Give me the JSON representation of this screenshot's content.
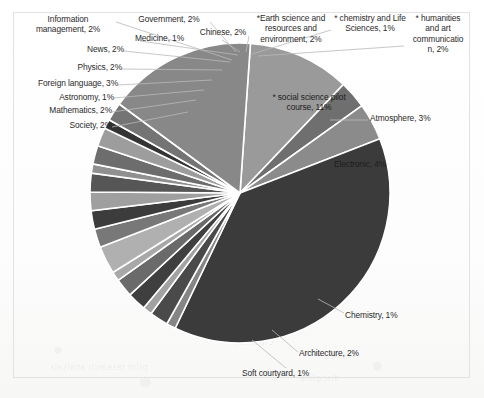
{
  "chart_data": {
    "type": "pie",
    "title": "",
    "legend_position": "none",
    "labels_outside": true,
    "units": "percent",
    "categories": [
      "* social science pilot course",
      "Atmosphere",
      "Electronic",
      "Computer",
      "Chemistry",
      "Architecture",
      "Soft courtyard",
      "Society",
      "Mathematics",
      "Astronomy",
      "Foreign language",
      "Physics",
      "News",
      "Information management",
      "Government",
      "Medicine",
      "Chinese",
      "* Earth science and resources and environment",
      "* chemistry and Life Sciences",
      "* humanities and art communication",
      "Other"
    ],
    "values": [
      11,
      3,
      4,
      38,
      1,
      2,
      1,
      2,
      2,
      1,
      3,
      2,
      2,
      2,
      2,
      1,
      2,
      2,
      1,
      2,
      16
    ],
    "value_labels": [
      "* social science pilot course, 11%",
      "Atmosphere, 3%",
      "Electronic, 4%",
      "",
      "Chemistry, 1%",
      "Architecture, 2%",
      "Soft courtyard, 1%",
      "Society, 2%",
      "Mathematics, 2%",
      "Astronomy, 1%",
      "Foreign language, 3%",
      "Physics, 2%",
      "News, 2%",
      "Information management, 2%",
      "Government, 2%",
      "Medicine, 1%",
      "Chinese, 2%",
      "*Earth science and resources and environment, 2%",
      "* chemistry and Life Sciences, 1%",
      "* humanities and art communication, 2%",
      ""
    ],
    "colors": [
      "#9a9a9a",
      "#6f6f6f",
      "#8b8b8b",
      "#3b3b3b",
      "#858585",
      "#4a4a4a",
      "#a2a2a2",
      "#3f3f3f",
      "#6a6a6a",
      "#a8a8a8",
      "#b0b0b0",
      "#787878",
      "#3c3c3c",
      "#9f9f9f",
      "#565656",
      "#909090",
      "#6d6d6d",
      "#9d9d9d",
      "#343434",
      "#747474",
      "#888888"
    ]
  },
  "labels": {
    "information_management": "Information\nmanagement, 2%",
    "government": "Government, 2%",
    "earth_science": "*Earth science and\nresources and\nenvironment, 2%",
    "chemistry_life_sciences": "* chemistry and Life\nSciences, 1%",
    "humanities_art": "* humanities\nand art\ncommunicatio\nn, 2%",
    "medicine": "Medicine, 1%",
    "chinese": "Chinese, 2%",
    "news": "News, 2%",
    "physics": "Physics, 2%",
    "foreign_language": "Foreign language, 3%",
    "astronomy": "Astronomy, 1%",
    "mathematics": "Mathematics, 2%",
    "society": "Society, 2%",
    "social_science_pilot": "* social science pilot\ncourse, 11%",
    "atmosphere": "Atmosphere, 3%",
    "electronic": "Electronic, 4%",
    "chemistry": "Chemistry, 1%",
    "architecture": "Architecture, 2%",
    "soft_courtyard": "Soft courtyard, 1%"
  },
  "style": {
    "frame_color": "#e2e2e2",
    "slice_separator": "#ffffff",
    "text_color": "#2b2b2b",
    "leader_color": "#b9b9b9"
  }
}
